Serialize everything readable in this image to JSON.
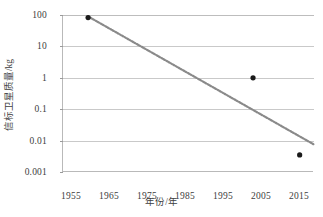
{
  "chart_data": {
    "type": "scatter",
    "title": "",
    "xlabel": "年份/年",
    "ylabel": "信标卫星质量/kg",
    "xlim": [
      1950,
      2020
    ],
    "ylim": [
      0.001,
      100
    ],
    "yscale": "log",
    "xscale": "linear",
    "grid": true,
    "legend": "none",
    "xticks": [
      "1955",
      "1965",
      "1975",
      "1985",
      "1995",
      "2005",
      "2015"
    ],
    "xtick_values": [
      1955,
      1965,
      1975,
      1985,
      1995,
      2005,
      2015
    ],
    "yticks": [
      "100",
      "10",
      "1",
      "0.1",
      "0.01",
      "0.001"
    ],
    "ytick_values": [
      100,
      10,
      1,
      0.1,
      0.01,
      0.001
    ],
    "series": [
      {
        "name": "信标卫星质量",
        "marker": "circle",
        "color": "#1a1a1a",
        "points": [
          {
            "x": 1957,
            "y": 83
          },
          {
            "x": 2003,
            "y": 1
          },
          {
            "x": 2016,
            "y": 0.0035
          }
        ]
      },
      {
        "name": "趋势线",
        "type": "trendline",
        "style": "dotted",
        "color": "#8a8a8a",
        "points": [
          {
            "x": 1957,
            "y": 90
          },
          {
            "x": 2020,
            "y": 0.0075
          }
        ]
      }
    ]
  },
  "axes": {
    "y_title": "信标卫星质量/kg",
    "x_title": "年份/年",
    "y_tick_labels": [
      "100",
      "10",
      "1",
      "0.1",
      "0.01",
      "0.001"
    ],
    "x_tick_labels": [
      "1955",
      "1965",
      "1975",
      "1985",
      "1995",
      "2005",
      "2015"
    ]
  },
  "colors": {
    "marker": "#1a1a1a",
    "trendline": "#8a8a8a",
    "grid": "#c9c9c9",
    "axis": "#b9b9b9",
    "text": "#3d3d3d",
    "background": "#ffffff"
  }
}
